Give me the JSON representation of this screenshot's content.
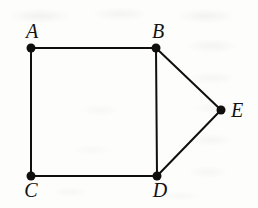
{
  "figure": {
    "kind": "undirected-graph-diagram",
    "width": 258,
    "height": 208,
    "background_color": "#fdfdfc",
    "ink_color": "#100f0e",
    "stroke_width": 2,
    "vertex_dot_radius": 4.5
  },
  "chart_data": {
    "type": "diagram",
    "title": "",
    "graph_type": "undirected simple graph",
    "nodes": [
      {
        "id": "A",
        "label": "A",
        "x": 31,
        "y": 48,
        "label_x": 32,
        "label_y": 41,
        "label_position": "above"
      },
      {
        "id": "B",
        "label": "B",
        "x": 156,
        "y": 48,
        "label_x": 158,
        "label_y": 41,
        "label_position": "above"
      },
      {
        "id": "C",
        "label": "C",
        "x": 31,
        "y": 176,
        "label_x": 31,
        "label_y": 180,
        "label_position": "below"
      },
      {
        "id": "D",
        "label": "D",
        "x": 157,
        "y": 176,
        "label_x": 160,
        "label_y": 180,
        "label_position": "below"
      },
      {
        "id": "E",
        "label": "E",
        "x": 221,
        "y": 110,
        "label_x": 231,
        "label_y": 110,
        "label_position": "right"
      }
    ],
    "edges": [
      {
        "id": "AB",
        "from": "A",
        "to": "B",
        "x1": 31,
        "y1": 48,
        "x2": 156,
        "y2": 48
      },
      {
        "id": "AC",
        "from": "A",
        "to": "C",
        "x1": 31,
        "y1": 48,
        "x2": 31,
        "y2": 176
      },
      {
        "id": "BD",
        "from": "B",
        "to": "D",
        "x1": 156,
        "y1": 48,
        "x2": 157,
        "y2": 176
      },
      {
        "id": "CD",
        "from": "C",
        "to": "D",
        "x1": 31,
        "y1": 176,
        "x2": 157,
        "y2": 176
      },
      {
        "id": "BE",
        "from": "B",
        "to": "E",
        "x1": 156,
        "y1": 48,
        "x2": 221,
        "y2": 110
      },
      {
        "id": "DE",
        "from": "D",
        "to": "E",
        "x1": 157,
        "y1": 176,
        "x2": 221,
        "y2": 110
      }
    ],
    "node_count": 5,
    "edge_count": 6,
    "degrees": {
      "A": 2,
      "B": 3,
      "C": 2,
      "D": 3,
      "E": 2
    }
  }
}
